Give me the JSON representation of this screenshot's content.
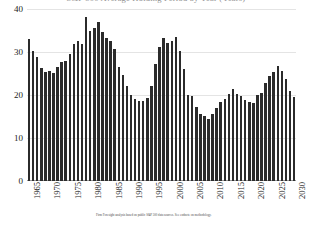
{
  "title": {
    "text": "S&P 500 Average Holding Period by Year (Years)",
    "visible_note": "cut off at top edge of image"
  },
  "footnote": {
    "text": "Firm Foresight analysis based on public S&P 500 data sources. See endnote on methodology."
  },
  "colors": {
    "bar": "#2b2b2b",
    "grid": "#e4e4e4",
    "axis": "#9a9a9a",
    "text": "#1a1a1a",
    "background": "#ffffff"
  },
  "chart_data": {
    "type": "bar",
    "title": "S&P 500 Average Holding Period by Year (Years)",
    "xlabel": "",
    "ylabel": "",
    "ylim": [
      0,
      40
    ],
    "yticks": [
      0,
      10,
      20,
      30,
      40
    ],
    "grid": true,
    "legend": false,
    "xtick_labels": [
      "1965",
      "1970",
      "1975",
      "1980",
      "1985",
      "1990",
      "1995",
      "2000",
      "2005",
      "2010",
      "2015",
      "2020",
      "2025",
      "2030"
    ],
    "categories": [
      "1965",
      "1966",
      "1967",
      "1968",
      "1969",
      "1970",
      "1971",
      "1972",
      "1973",
      "1974",
      "1975",
      "1976",
      "1977",
      "1978",
      "1979",
      "1980",
      "1981",
      "1982",
      "1983",
      "1984",
      "1985",
      "1986",
      "1987",
      "1988",
      "1989",
      "1990",
      "1991",
      "1992",
      "1993",
      "1994",
      "1995",
      "1996",
      "1997",
      "1998",
      "1999",
      "2000",
      "2001",
      "2002",
      "2003",
      "2004",
      "2005",
      "2006",
      "2007",
      "2008",
      "2009",
      "2010",
      "2011",
      "2012",
      "2013",
      "2014",
      "2015",
      "2016",
      "2017",
      "2018",
      "2019",
      "2020",
      "2021",
      "2022",
      "2023",
      "2024",
      "2025",
      "2026",
      "2027",
      "2028",
      "2029",
      "2030"
    ],
    "values": [
      33.0,
      30.2,
      28.9,
      26.3,
      25.4,
      25.6,
      25.2,
      26.4,
      27.7,
      27.8,
      29.5,
      31.9,
      32.6,
      31.9,
      38.2,
      35.0,
      35.6,
      36.9,
      34.6,
      33.3,
      32.6,
      30.7,
      26.5,
      24.6,
      22.2,
      20.1,
      19.1,
      18.6,
      18.7,
      19.4,
      22.2,
      27.2,
      31.2,
      33.3,
      32.2,
      32.5,
      33.4,
      30.3,
      26.0,
      20.0,
      19.8,
      17.1,
      15.6,
      15.1,
      14.5,
      15.6,
      17.0,
      18.4,
      19.0,
      20.3,
      21.3,
      20.2,
      19.8,
      18.9,
      18.3,
      18.2,
      19.9,
      20.4,
      22.8,
      24.5,
      25.3,
      26.8,
      25.5,
      23.7,
      21.0,
      19.6
    ],
    "series": [
      {
        "name": "Average holding period",
        "values": [
          33.0,
          30.2,
          28.9,
          26.3,
          25.4,
          25.6,
          25.2,
          26.4,
          27.7,
          27.8,
          29.5,
          31.9,
          32.6,
          31.9,
          38.2,
          35.0,
          35.6,
          36.9,
          34.6,
          33.3,
          32.6,
          30.7,
          26.5,
          24.6,
          22.2,
          20.1,
          19.1,
          18.6,
          18.7,
          19.4,
          22.2,
          27.2,
          31.2,
          33.3,
          32.2,
          32.5,
          33.4,
          30.3,
          26.0,
          20.0,
          19.8,
          17.1,
          15.6,
          15.1,
          14.5,
          15.6,
          17.0,
          18.4,
          19.0,
          20.3,
          21.3,
          20.2,
          19.8,
          18.9,
          18.3,
          18.2,
          19.9,
          20.4,
          22.8,
          24.5,
          25.3,
          26.8,
          25.5,
          23.7,
          21.0,
          19.6
        ]
      }
    ]
  }
}
